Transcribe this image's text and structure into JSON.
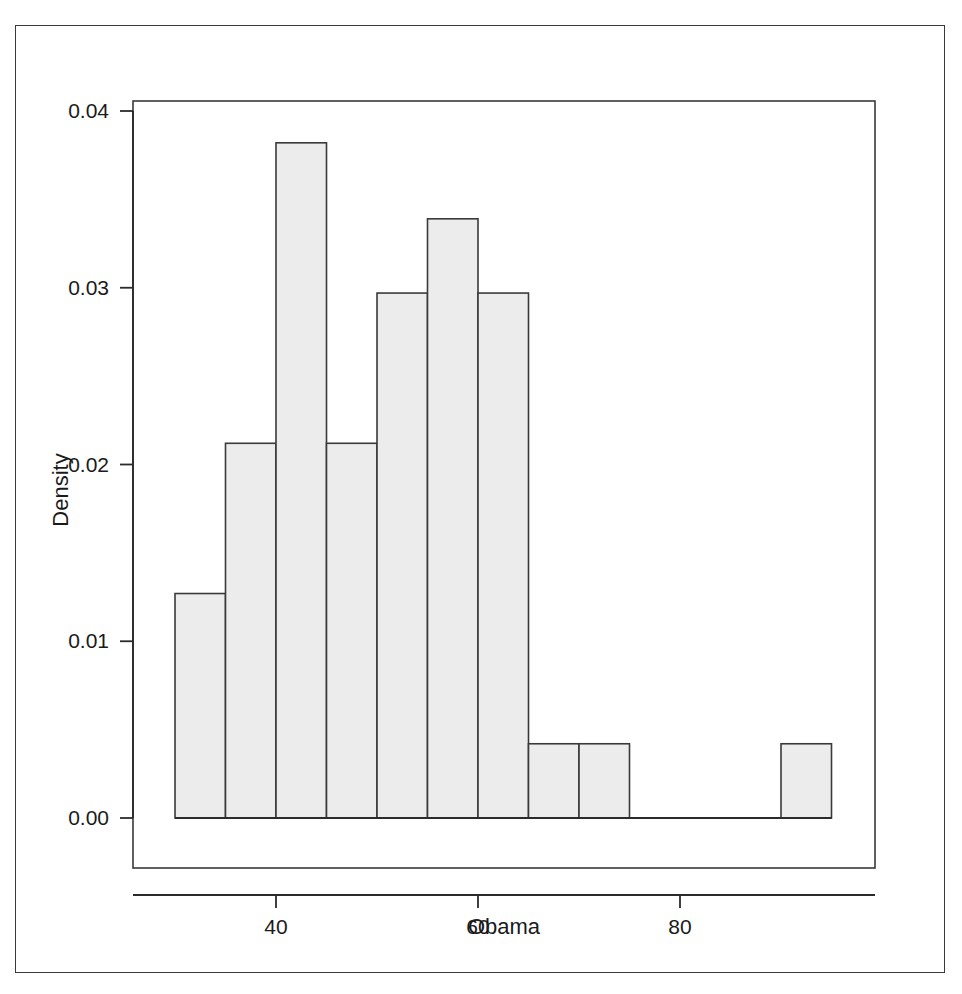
{
  "chart_data": {
    "type": "bar",
    "subtype": "histogram",
    "title": "",
    "xlabel": "Obama",
    "ylabel": "Density",
    "xlim": [
      29.5,
      96.5
    ],
    "ylim": [
      0.0,
      0.0415
    ],
    "grid": false,
    "legend": null,
    "bin_width": 5,
    "x_ticks": [
      40,
      60,
      80
    ],
    "x_tick_labels": [
      "40",
      "60",
      "80"
    ],
    "y_ticks": [
      0.0,
      0.01,
      0.02,
      0.03,
      0.04
    ],
    "y_tick_labels": [
      "0.00",
      "0.01",
      "0.02",
      "0.03",
      "0.04"
    ],
    "bins": [
      {
        "left": 30,
        "right": 35,
        "density": 0.0127
      },
      {
        "left": 35,
        "right": 40,
        "density": 0.0212
      },
      {
        "left": 40,
        "right": 45,
        "density": 0.0382
      },
      {
        "left": 45,
        "right": 50,
        "density": 0.0212
      },
      {
        "left": 50,
        "right": 55,
        "density": 0.0297
      },
      {
        "left": 55,
        "right": 60,
        "density": 0.0339
      },
      {
        "left": 60,
        "right": 65,
        "density": 0.0297
      },
      {
        "left": 65,
        "right": 70,
        "density": 0.0042
      },
      {
        "left": 70,
        "right": 75,
        "density": 0.0042
      },
      {
        "left": 75,
        "right": 80,
        "density": 0.0
      },
      {
        "left": 80,
        "right": 85,
        "density": 0.0
      },
      {
        "left": 85,
        "right": 90,
        "density": 0.0
      },
      {
        "left": 90,
        "right": 95,
        "density": 0.0042
      }
    ],
    "categories": [
      "30-35",
      "35-40",
      "40-45",
      "45-50",
      "50-55",
      "55-60",
      "60-65",
      "65-70",
      "70-75",
      "75-80",
      "80-85",
      "85-90",
      "90-95"
    ],
    "values": [
      0.0127,
      0.0212,
      0.0382,
      0.0212,
      0.0297,
      0.0339,
      0.0297,
      0.0042,
      0.0042,
      0.0,
      0.0,
      0.0,
      0.0042
    ]
  },
  "style": {
    "bar_fill": "#ececec",
    "bar_stroke": "#3a3a3a",
    "axis_color": "#2b2b2b",
    "frame_color": "#3a3a3a",
    "text_color": "#1a1a1a",
    "background": "#ffffff"
  },
  "geometry": {
    "plot_left": 133,
    "plot_right": 875,
    "plot_top": 101,
    "plot_bottom": 868,
    "baseline_y": 818,
    "y_unit_px": 17700,
    "x_origin_px": 175,
    "x_unit_px": 10.1
  }
}
